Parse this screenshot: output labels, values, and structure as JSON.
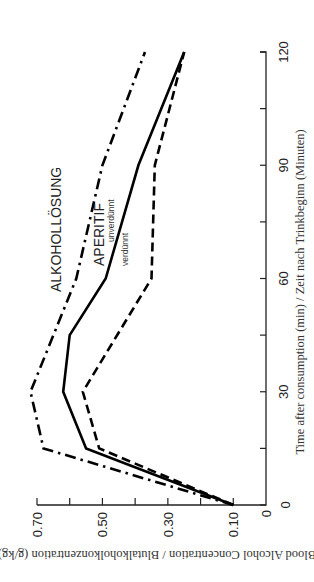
{
  "chart_data": {
    "type": "line",
    "orientation": "rotated-90-ccw",
    "title": "",
    "xlabel": "Time after consumption (min) / Zeit nach Trinkbeginn (Minuten)",
    "ylabel": "Blood Alcohol Concentration / Blutalkoholkonzentration (g/kg)",
    "xlim": [
      0,
      120
    ],
    "ylim": [
      0,
      0.7
    ],
    "x_ticks": [
      0,
      15,
      30,
      45,
      60,
      75,
      90,
      105,
      120
    ],
    "x_tick_labels": [
      "0",
      "30",
      "60",
      "90",
      "120"
    ],
    "x_tick_label_values": [
      0,
      30,
      60,
      90,
      120
    ],
    "y_ticks": [
      0.1,
      0.2,
      0.3,
      0.4,
      0.5,
      0.6,
      0.7
    ],
    "y_tick_labels": [
      "0",
      "0.10",
      "0.30",
      "0.50",
      "0.70"
    ],
    "y_tick_label_values": [
      0,
      0.1,
      0.3,
      0.5,
      0.7
    ],
    "grid": false,
    "legend": "inline labels",
    "series": [
      {
        "name": "ALKOHOLLÖSUNG",
        "style": "dash-dot",
        "x": [
          0,
          15,
          30,
          60,
          90,
          120
        ],
        "values": [
          0.1,
          0.68,
          0.72,
          0.58,
          0.5,
          0.37
        ]
      },
      {
        "name": "APERITIF unverdünnt",
        "style": "solid",
        "x": [
          0,
          15,
          30,
          45,
          60,
          90,
          120
        ],
        "values": [
          0.1,
          0.55,
          0.62,
          0.6,
          0.49,
          0.39,
          0.25
        ]
      },
      {
        "name": "APERITIF verdünnt",
        "style": "dashed",
        "x": [
          0,
          15,
          30,
          60,
          90,
          120
        ],
        "values": [
          0.1,
          0.51,
          0.56,
          0.35,
          0.34,
          0.25
        ]
      }
    ],
    "annotations": {
      "alkohol": "ALKOHOLLÖSUNG",
      "aperitif": "APERITIF",
      "unverduennt": "unverdünnt",
      "verduennt": "verdünnt"
    }
  }
}
